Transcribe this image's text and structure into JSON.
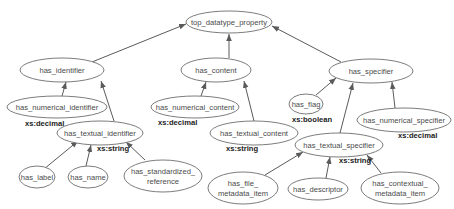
{
  "diagram": {
    "type": "property-hierarchy",
    "nodes": [
      {
        "id": "top",
        "label": "top_datatype_property"
      },
      {
        "id": "ident",
        "label": "has_identifier"
      },
      {
        "id": "content",
        "label": "has_content"
      },
      {
        "id": "spec",
        "label": "has_specifier"
      },
      {
        "id": "numident",
        "label": "has_numerical_identifier",
        "type": "xs:decimal"
      },
      {
        "id": "numcontent",
        "label": "has_numerical_content",
        "type": "xs:decimal"
      },
      {
        "id": "flag",
        "label": "has_flag",
        "type": "xs:boolean"
      },
      {
        "id": "numspec",
        "label": "has_numerical_specifier",
        "type": "xs:decimal"
      },
      {
        "id": "textident",
        "label": "has_textual_identifier",
        "type": "xs:string"
      },
      {
        "id": "textcontent",
        "label": "has_textual_content",
        "type": "xs:string"
      },
      {
        "id": "textspec",
        "label": "has_textual_specifier",
        "type": "xs:string"
      },
      {
        "id": "label",
        "label": "has_label"
      },
      {
        "id": "name",
        "label": "has_name"
      },
      {
        "id": "stdref",
        "label_line1": "has_standardized_",
        "label_line2": "reference"
      },
      {
        "id": "filemeta",
        "label_line1": "has_file_",
        "label_line2": "metadata_item"
      },
      {
        "id": "descriptor",
        "label": "has_descriptor"
      },
      {
        "id": "ctxmeta",
        "label_line1": "has_contextual_",
        "label_line2": "metadata_item"
      }
    ],
    "edges": [
      {
        "from": "ident",
        "to": "top"
      },
      {
        "from": "content",
        "to": "top"
      },
      {
        "from": "spec",
        "to": "top"
      },
      {
        "from": "numident",
        "to": "ident"
      },
      {
        "from": "textident",
        "to": "ident"
      },
      {
        "from": "numcontent",
        "to": "content"
      },
      {
        "from": "textcontent",
        "to": "content"
      },
      {
        "from": "flag",
        "to": "spec"
      },
      {
        "from": "textspec",
        "to": "spec"
      },
      {
        "from": "numspec",
        "to": "spec"
      },
      {
        "from": "label",
        "to": "textident"
      },
      {
        "from": "name",
        "to": "textident"
      },
      {
        "from": "stdref",
        "to": "textident"
      },
      {
        "from": "filemeta",
        "to": "textspec"
      },
      {
        "from": "descriptor",
        "to": "textspec"
      },
      {
        "from": "ctxmeta",
        "to": "textspec"
      }
    ],
    "types": {
      "numident": "xs:decimal",
      "numcontent": "xs:decimal",
      "flag": "xs:boolean",
      "numspec": "xs:decimal",
      "textident": "xs:string",
      "textcontent": "xs:string",
      "textspec": "xs:string"
    },
    "colors": {
      "stroke": "#6d6d6d",
      "text": "#4a4a4a",
      "type_text": "#222222",
      "background": "#ffffff"
    }
  }
}
